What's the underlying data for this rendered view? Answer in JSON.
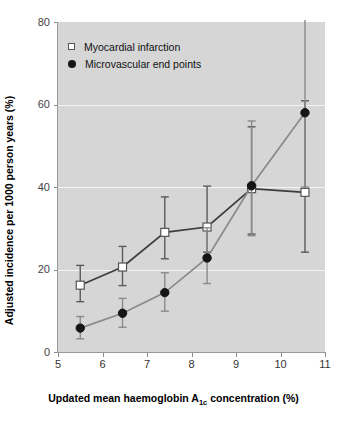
{
  "chart_data": {
    "type": "line",
    "title": "",
    "xlabel": "Updated mean haemoglobin A1c concentration (%)",
    "xlabel_pre": "Updated mean haemoglobin A",
    "xlabel_sub": "1c",
    "xlabel_post": " concentration (%)",
    "ylabel": "Adjusted incidence per 1000 person years (%)",
    "xlim": [
      5,
      11
    ],
    "ylim": [
      0,
      80
    ],
    "xticks": [
      5,
      6,
      7,
      8,
      9,
      10,
      11
    ],
    "yticks": [
      0,
      20,
      40,
      60,
      80
    ],
    "xtick_labels": [
      "5",
      "6",
      "7",
      "8",
      "9",
      "10",
      "11"
    ],
    "ytick_labels": [
      "0",
      "20",
      "40",
      "60",
      "80"
    ],
    "grid": "horizontal-white",
    "legend_position": "upper-left-inside",
    "plot_background": "#d6d6d6",
    "gridline_color": "#f4f4f4",
    "series": [
      {
        "name": "Myocardial infarction",
        "marker": "open-square",
        "marker_face": "#ffffff",
        "marker_edge": "#555555",
        "line_color": "#3c3c3c",
        "x": [
          5.5,
          6.45,
          7.4,
          8.35,
          9.35,
          10.55
        ],
        "values": [
          16.2,
          20.6,
          29.0,
          30.3,
          39.6,
          38.7
        ],
        "err_low": [
          12.2,
          16.1,
          22.6,
          24.2,
          28.6,
          24.2
        ],
        "err_high": [
          21.0,
          25.6,
          37.6,
          40.2,
          54.6,
          60.9
        ]
      },
      {
        "name": "Microvascular end points",
        "marker": "filled-circle",
        "marker_face": "#151515",
        "marker_edge": "#151515",
        "line_color": "#8a8a8a",
        "x": [
          5.5,
          6.45,
          7.4,
          8.35,
          9.35,
          10.55
        ],
        "values": [
          5.8,
          9.4,
          14.4,
          22.8,
          40.3,
          58.0
        ],
        "err_low": [
          3.2,
          6.0,
          9.9,
          16.6,
          28.2,
          40.0
        ],
        "err_high": [
          8.6,
          13.0,
          19.2,
          30.1,
          56.0,
          80.2
        ],
        "err_high_broken_at_top": true
      }
    ],
    "legend": [
      {
        "label": "Myocardial infarction",
        "marker": "open-square"
      },
      {
        "label": "Microvascular end points",
        "marker": "filled-circle"
      }
    ]
  }
}
